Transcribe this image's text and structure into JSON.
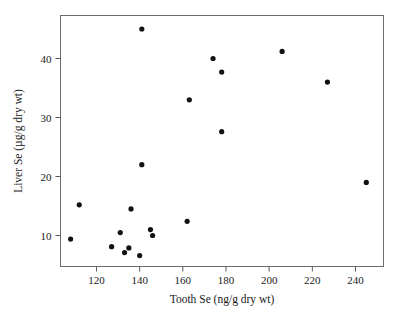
{
  "chart_data": {
    "type": "scatter",
    "title": "",
    "xlabel": "Tooth Se (ng/g dry wt)",
    "ylabel": "Liver Se (µg/g dry wt)",
    "xlim": [
      105,
      253
    ],
    "ylim": [
      4.5,
      47
    ],
    "xticks": [
      120,
      140,
      160,
      180,
      200,
      220,
      240
    ],
    "yticks": [
      10,
      20,
      30,
      40
    ],
    "xtick_labels": [
      "120",
      "140",
      "160",
      "180",
      "200",
      "220",
      "240"
    ],
    "ytick_labels": [
      "10",
      "20",
      "30",
      "40"
    ],
    "grid": false,
    "legend": null,
    "marker": "filled-circle",
    "marker_color": "#111111",
    "points": [
      {
        "x": 108,
        "y": 9.4
      },
      {
        "x": 112,
        "y": 15.2
      },
      {
        "x": 127,
        "y": 8.1
      },
      {
        "x": 131,
        "y": 10.5
      },
      {
        "x": 133,
        "y": 7.1
      },
      {
        "x": 135,
        "y": 7.9
      },
      {
        "x": 136,
        "y": 14.5
      },
      {
        "x": 140,
        "y": 6.6
      },
      {
        "x": 141,
        "y": 22.0
      },
      {
        "x": 141,
        "y": 45.0
      },
      {
        "x": 145,
        "y": 11.0
      },
      {
        "x": 146,
        "y": 10.0
      },
      {
        "x": 162,
        "y": 12.4
      },
      {
        "x": 163,
        "y": 33.0
      },
      {
        "x": 174,
        "y": 40.0
      },
      {
        "x": 178,
        "y": 37.7
      },
      {
        "x": 178,
        "y": 27.6
      },
      {
        "x": 206,
        "y": 41.2
      },
      {
        "x": 227,
        "y": 36.0
      },
      {
        "x": 245,
        "y": 19.0
      }
    ],
    "n_points": 20
  },
  "axes": {
    "frame_color": "#6b6b6b",
    "background": "#ffffff"
  }
}
